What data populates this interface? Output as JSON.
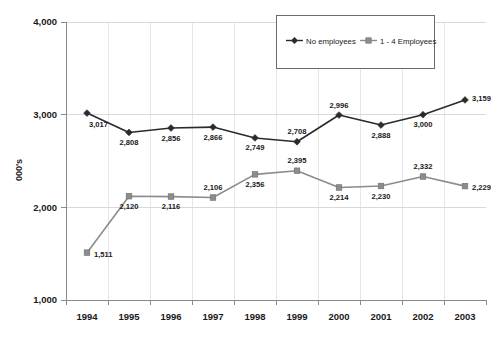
{
  "chart_data": {
    "type": "line",
    "title": "",
    "subtitle": "",
    "xlabel": "",
    "ylabel": "000's",
    "categories": [
      "1994",
      "1995",
      "1996",
      "1997",
      "1998",
      "1999",
      "2000",
      "2001",
      "2002",
      "2003"
    ],
    "ylim": [
      1000,
      4000
    ],
    "y_ticks": [
      "1,000",
      "2,000",
      "3,000",
      "4,000"
    ],
    "y_tick_values": [
      1000,
      2000,
      3000,
      4000
    ],
    "grid": {
      "horizontal": true,
      "vertical": true
    },
    "legend_position": "top-right",
    "series": [
      {
        "name": "No employees",
        "color": "#2b2b2b",
        "marker": "diamond",
        "values": [
          3017,
          2808,
          2856,
          2866,
          2749,
          2708,
          2996,
          2888,
          3000,
          3159
        ],
        "labels": [
          "3,017",
          "2,808",
          "2,856",
          "2,866",
          "2,749",
          "2,708",
          "2,996",
          "2,888",
          "3,000",
          "3,159"
        ]
      },
      {
        "name": "1 - 4 Employees",
        "color": "#8c8c8c",
        "marker": "square",
        "values": [
          1511,
          2120,
          2116,
          2106,
          2356,
          2395,
          2214,
          2230,
          2332,
          2229
        ],
        "labels": [
          "1,511",
          "2,120",
          "2,116",
          "2,106",
          "2,356",
          "2,395",
          "2,214",
          "2,230",
          "2,332",
          "2,229"
        ]
      }
    ]
  },
  "legend": {
    "items": [
      {
        "label": "No employees"
      },
      {
        "label": "1 - 4 Employees"
      }
    ]
  }
}
